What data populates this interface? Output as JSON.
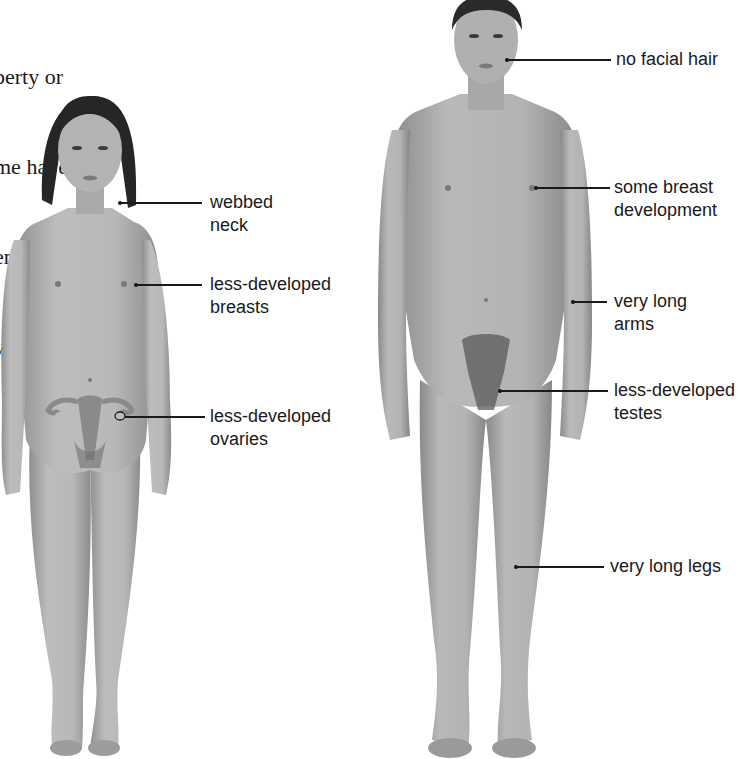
{
  "body_text": {
    "lines": [
      "berty or",
      "me have",
      "en",
      "y"
    ]
  },
  "figure_female": {
    "name": "Turner syndrome female figure",
    "labels": [
      {
        "id": "webbed-neck",
        "lines": [
          "webbed",
          "neck"
        ]
      },
      {
        "id": "less-developed-breasts",
        "lines": [
          "less-developed",
          "breasts"
        ]
      },
      {
        "id": "less-developed-ovaries",
        "lines": [
          "less-developed",
          "ovaries"
        ]
      }
    ]
  },
  "figure_male": {
    "name": "Klinefelter syndrome male figure",
    "labels": [
      {
        "id": "no-facial-hair",
        "lines": [
          "no facial hair"
        ]
      },
      {
        "id": "some-breast-development",
        "lines": [
          "some breast",
          "development"
        ]
      },
      {
        "id": "very-long-arms",
        "lines": [
          "very long",
          "arms"
        ]
      },
      {
        "id": "less-developed-testes",
        "lines": [
          "less-developed",
          "testes"
        ]
      },
      {
        "id": "very-long-legs",
        "lines": [
          "very long legs"
        ]
      }
    ]
  },
  "colors": {
    "skin": "#b4b4b4",
    "skin_shadow": "#8e8e8e",
    "hair": "#2a2a2a",
    "text": "#1a1a1a",
    "background": "#ffffff"
  }
}
